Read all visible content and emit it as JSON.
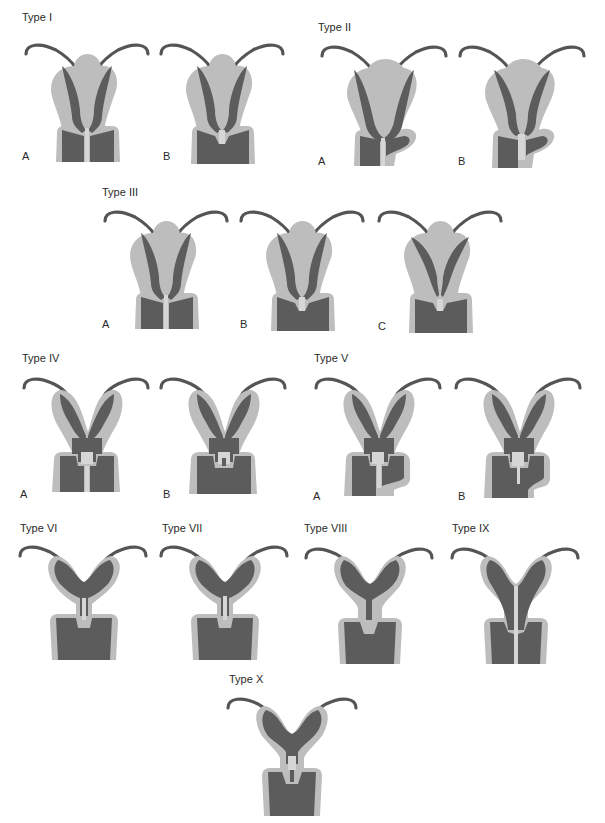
{
  "figure": {
    "colors": {
      "myometrium": "#bdbdbd",
      "cavity": "#5c5c5c",
      "septum": "#e6e6e6",
      "background": "#ffffff"
    },
    "groups": [
      {
        "id": "type-1",
        "title": "Type I",
        "variants": [
          {
            "label": "A"
          },
          {
            "label": "B"
          }
        ]
      },
      {
        "id": "type-2",
        "title": "Type II",
        "variants": [
          {
            "label": "A"
          },
          {
            "label": "B"
          }
        ]
      },
      {
        "id": "type-3",
        "title": "Type III",
        "variants": [
          {
            "label": "A"
          },
          {
            "label": "B"
          },
          {
            "label": "C"
          }
        ]
      },
      {
        "id": "type-4",
        "title": "Type IV",
        "variants": [
          {
            "label": "A"
          },
          {
            "label": "B"
          }
        ]
      },
      {
        "id": "type-5",
        "title": "Type V",
        "variants": [
          {
            "label": "A"
          },
          {
            "label": "B"
          }
        ]
      },
      {
        "id": "type-6",
        "title": "Type VI"
      },
      {
        "id": "type-7",
        "title": "Type VII"
      },
      {
        "id": "type-8",
        "title": "Type VIII"
      },
      {
        "id": "type-9",
        "title": "Type IX"
      },
      {
        "id": "type-10",
        "title": "Type X"
      }
    ]
  }
}
